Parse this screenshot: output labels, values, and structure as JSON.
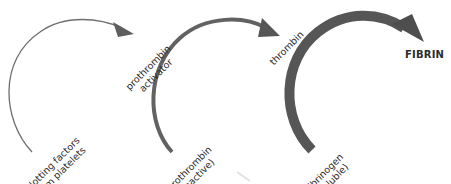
{
  "diagram": {
    "colors": {
      "background": "#ffffff",
      "arrow_thin": "#6e6e6e",
      "arrow_medium": "#626262",
      "arrow_thick": "#565656",
      "text": "#2b2b2b"
    },
    "stages": [
      {
        "id": "stage-1",
        "from": {
          "line1": "clotting factors",
          "line2": "from platelets"
        },
        "to": {
          "line1": "prothrombin",
          "line2": "activator"
        },
        "arrow_weight": "thin"
      },
      {
        "id": "stage-2",
        "from": {
          "line1": "prothrombin",
          "line2": "(inactive)"
        },
        "to": {
          "line1": "thrombin"
        },
        "arrow_weight": "medium"
      },
      {
        "id": "stage-3",
        "from": {
          "line1": "fibrinogen",
          "line2": "(soluble)"
        },
        "to": {
          "line1": "FIBRIN"
        },
        "arrow_weight": "thick"
      }
    ]
  }
}
